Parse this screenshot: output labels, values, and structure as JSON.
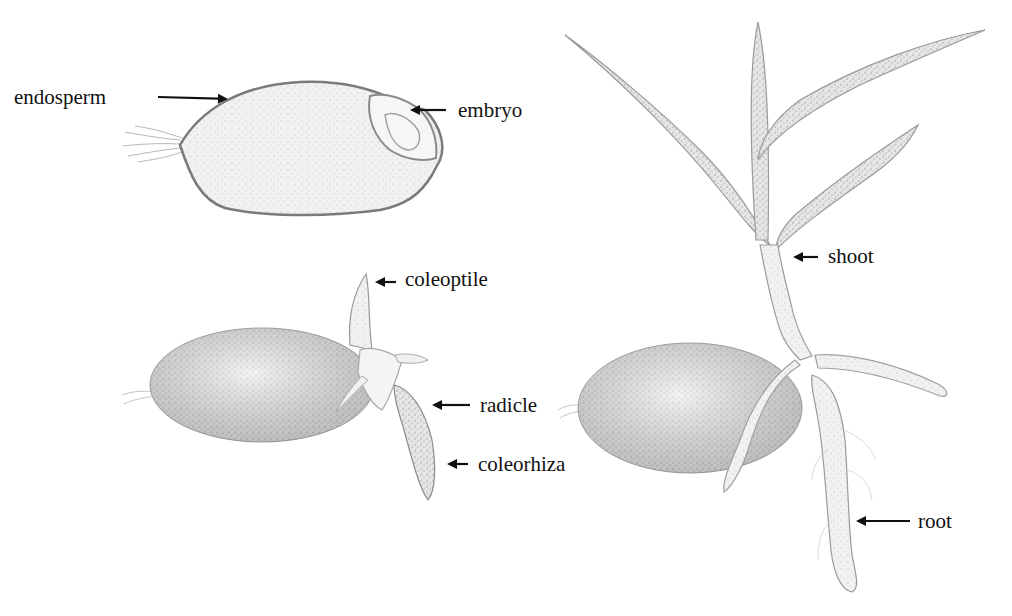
{
  "figure": {
    "panels": [
      {
        "id": "grain",
        "labels": [
          {
            "text": "endosperm",
            "x": 14,
            "y": 87,
            "arrow": {
              "x1": 158,
              "y1": 97,
              "x2": 228,
              "y2": 99
            }
          },
          {
            "text": "embryo",
            "x": 458,
            "y": 100,
            "arrow": {
              "x1": 446,
              "y1": 110,
              "x2": 410,
              "y2": 110
            }
          }
        ]
      },
      {
        "id": "early-germination",
        "labels": [
          {
            "text": "coleoptile",
            "x": 405,
            "y": 269,
            "arrow": {
              "x1": 396,
              "y1": 282,
              "x2": 375,
              "y2": 282
            }
          },
          {
            "text": "radicle",
            "x": 480,
            "y": 395,
            "arrow": {
              "x1": 470,
              "y1": 405,
              "x2": 432,
              "y2": 405
            }
          },
          {
            "text": "coleorhiza",
            "x": 478,
            "y": 454,
            "arrow": {
              "x1": 468,
              "y1": 464,
              "x2": 447,
              "y2": 464
            }
          }
        ]
      },
      {
        "id": "seedling",
        "labels": [
          {
            "text": "shoot",
            "x": 828,
            "y": 246,
            "arrow": {
              "x1": 818,
              "y1": 257,
              "x2": 793,
              "y2": 257
            }
          },
          {
            "text": "root",
            "x": 918,
            "y": 511,
            "arrow": {
              "x1": 910,
              "y1": 521,
              "x2": 856,
              "y2": 521
            }
          }
        ]
      }
    ],
    "colors": {
      "background": "#ffffff",
      "text": "#111111",
      "arrow": "#111111",
      "sketch_dark": "#6e6e6e",
      "sketch_mid": "#a8a8a8",
      "sketch_light": "#dcdcdc"
    }
  }
}
